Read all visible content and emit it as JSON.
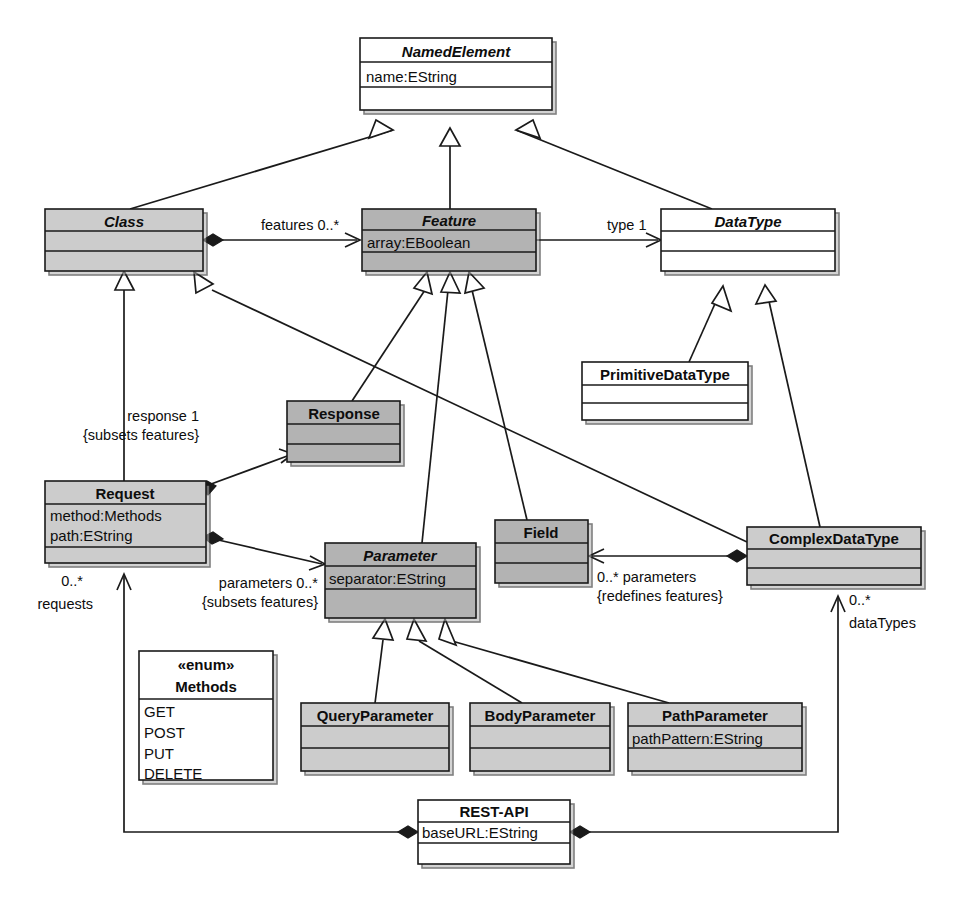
{
  "diagram": {
    "kind": "uml-class-diagram",
    "colors": {
      "line": "#1a1a1a",
      "fill_white": "#ffffff",
      "fill_light_gray": "#cccccc",
      "fill_mid_gray": "#b3b3b3",
      "text": "#0d0d0d"
    }
  },
  "classes": [
    {
      "id": "NamedElement",
      "name": "NamedElement",
      "abstract": true,
      "fill": "white",
      "attributes": [
        "name:EString"
      ],
      "operations": [],
      "x": 360,
      "y": 38,
      "w": 192,
      "h": 72
    },
    {
      "id": "Class",
      "name": "Class",
      "abstract": true,
      "fill": "light",
      "attributes": [],
      "operations": [],
      "x": 45,
      "y": 209,
      "w": 158,
      "h": 62
    },
    {
      "id": "Feature",
      "name": "Feature",
      "abstract": true,
      "fill": "mid",
      "attributes": [
        "array:EBoolean"
      ],
      "operations": [],
      "x": 362,
      "y": 209,
      "w": 174,
      "h": 62
    },
    {
      "id": "DataType",
      "name": "DataType",
      "abstract": true,
      "fill": "white",
      "attributes": [],
      "operations": [],
      "x": 661,
      "y": 209,
      "w": 174,
      "h": 62
    },
    {
      "id": "PrimitiveDataType",
      "name": "PrimitiveDataType",
      "abstract": false,
      "fill": "white",
      "attributes": [],
      "operations": [],
      "x": 582,
      "y": 362,
      "w": 166,
      "h": 58
    },
    {
      "id": "Response",
      "name": "Response",
      "abstract": false,
      "fill": "mid",
      "attributes": [],
      "operations": [],
      "x": 287,
      "y": 401,
      "w": 113,
      "h": 61
    },
    {
      "id": "Request",
      "name": "Request",
      "abstract": false,
      "fill": "light",
      "attributes": [
        "method:Methods",
        "path:EString"
      ],
      "operations": [],
      "x": 45,
      "y": 481,
      "w": 161,
      "h": 82
    },
    {
      "id": "Parameter",
      "name": "Parameter",
      "abstract": true,
      "fill": "mid",
      "attributes": [
        "separator:EString"
      ],
      "operations": [],
      "x": 325,
      "y": 543,
      "w": 151,
      "h": 75
    },
    {
      "id": "Field",
      "name": "Field",
      "abstract": false,
      "fill": "mid",
      "attributes": [],
      "operations": [],
      "x": 495,
      "y": 520,
      "w": 93,
      "h": 63
    },
    {
      "id": "ComplexDataType",
      "name": "ComplexDataType",
      "abstract": false,
      "fill": "light",
      "attributes": [],
      "operations": [],
      "x": 747,
      "y": 527,
      "w": 174,
      "h": 58
    },
    {
      "id": "QueryParameter",
      "name": "QueryParameter",
      "abstract": false,
      "fill": "light",
      "attributes": [],
      "operations": [],
      "x": 301,
      "y": 703,
      "w": 148,
      "h": 68
    },
    {
      "id": "BodyParameter",
      "name": "BodyParameter",
      "abstract": false,
      "fill": "light",
      "attributes": [],
      "operations": [],
      "x": 470,
      "y": 703,
      "w": 140,
      "h": 68
    },
    {
      "id": "PathParameter",
      "name": "PathParameter",
      "abstract": false,
      "fill": "light",
      "attributes": [
        "pathPattern:EString"
      ],
      "operations": [],
      "x": 628,
      "y": 703,
      "w": 174,
      "h": 68
    },
    {
      "id": "REST-API",
      "name": "REST-API",
      "abstract": false,
      "fill": "white",
      "attributes": [
        "baseURL:EString"
      ],
      "operations": [],
      "x": 418,
      "y": 800,
      "w": 152,
      "h": 64
    }
  ],
  "enumerations": [
    {
      "id": "Methods",
      "stereotype": "«enum»",
      "name": "Methods",
      "literals": [
        "GET",
        "POST",
        "PUT",
        "DELETE"
      ],
      "x": 139,
      "y": 651,
      "w": 134,
      "h": 129
    }
  ],
  "relationships": [
    {
      "id": "gen-class-namedelement",
      "type": "generalization",
      "source": "Class",
      "target": "NamedElement",
      "label": ""
    },
    {
      "id": "gen-feature-namedelement",
      "type": "generalization",
      "source": "Feature",
      "target": "NamedElement",
      "label": ""
    },
    {
      "id": "gen-datatype-namedelement",
      "type": "generalization",
      "source": "DataType",
      "target": "NamedElement",
      "label": ""
    },
    {
      "id": "assoc-class-features",
      "type": "composition",
      "source": "Class",
      "target": "Feature",
      "label": "features 0..*"
    },
    {
      "id": "assoc-feature-type",
      "type": "association",
      "source": "Feature",
      "target": "DataType",
      "label": "type 1"
    },
    {
      "id": "gen-primitivedatatype-datatype",
      "type": "generalization",
      "source": "PrimitiveDataType",
      "target": "DataType",
      "label": ""
    },
    {
      "id": "gen-complexdatatype-datatype",
      "type": "generalization",
      "source": "ComplexDataType",
      "target": "DataType",
      "label": ""
    },
    {
      "id": "gen-request-class",
      "type": "generalization",
      "source": "Request",
      "target": "Class",
      "label": ""
    },
    {
      "id": "gen-complexdatatype-class",
      "type": "generalization",
      "source": "ComplexDataType",
      "target": "Class",
      "label": ""
    },
    {
      "id": "gen-response-feature",
      "type": "generalization",
      "source": "Response",
      "target": "Feature",
      "label": ""
    },
    {
      "id": "gen-parameter-feature",
      "type": "generalization",
      "source": "Parameter",
      "target": "Feature",
      "label": ""
    },
    {
      "id": "gen-field-feature",
      "type": "generalization",
      "source": "Field",
      "target": "Feature",
      "label": ""
    },
    {
      "id": "assoc-request-response",
      "type": "composition",
      "source": "Request",
      "target": "Response",
      "label": "response 1 {subsets features}"
    },
    {
      "id": "assoc-request-parameters",
      "type": "composition",
      "source": "Request",
      "target": "Parameter",
      "label": "parameters 0..* {subsets features}"
    },
    {
      "id": "assoc-complexdatatype-field",
      "type": "composition",
      "source": "ComplexDataType",
      "target": "Field",
      "label": "0..* parameters {redefines features}"
    },
    {
      "id": "gen-queryparameter-parameter",
      "type": "generalization",
      "source": "QueryParameter",
      "target": "Parameter",
      "label": ""
    },
    {
      "id": "gen-bodyparameter-parameter",
      "type": "generalization",
      "source": "BodyParameter",
      "target": "Parameter",
      "label": ""
    },
    {
      "id": "gen-pathparameter-parameter",
      "type": "generalization",
      "source": "PathParameter",
      "target": "Parameter",
      "label": ""
    },
    {
      "id": "assoc-restapi-requests",
      "type": "composition",
      "source": "REST-API",
      "target": "Request",
      "label": "0..* requests"
    },
    {
      "id": "assoc-restapi-datatypes",
      "type": "composition",
      "source": "REST-API",
      "target": "ComplexDataType",
      "label": "0..* dataTypes"
    }
  ],
  "edge_labels": {
    "features": "features 0..*",
    "type": "type 1",
    "response_role": "response 1",
    "response_constraint": "{subsets features}",
    "parameters_role": "parameters 0..*",
    "parameters_constraint": "{subsets features}",
    "field_role": "0..* parameters",
    "field_constraint": "{redefines features}",
    "requests_mult": "0..*",
    "requests_role": "requests",
    "datatypes_mult": "0..*",
    "datatypes_role": "dataTypes"
  }
}
